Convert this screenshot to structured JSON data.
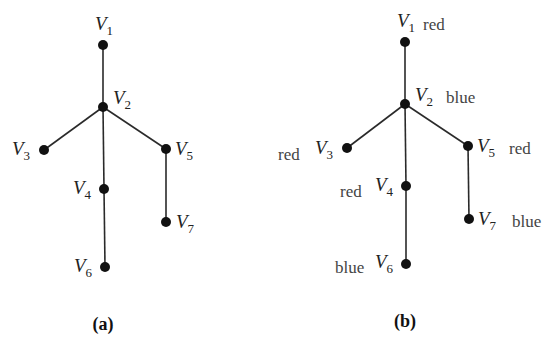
{
  "figures": [
    {
      "id": "a",
      "caption": "(a)",
      "vertices": [
        {
          "name": "V",
          "sub": "1",
          "color": ""
        },
        {
          "name": "V",
          "sub": "2",
          "color": ""
        },
        {
          "name": "V",
          "sub": "3",
          "color": ""
        },
        {
          "name": "V",
          "sub": "4",
          "color": ""
        },
        {
          "name": "V",
          "sub": "5",
          "color": ""
        },
        {
          "name": "V",
          "sub": "6",
          "color": ""
        },
        {
          "name": "V",
          "sub": "7",
          "color": ""
        }
      ]
    },
    {
      "id": "b",
      "caption": "(b)",
      "vertices": [
        {
          "name": "V",
          "sub": "1",
          "color": "red"
        },
        {
          "name": "V",
          "sub": "2",
          "color": "blue"
        },
        {
          "name": "V",
          "sub": "3",
          "color": "red"
        },
        {
          "name": "V",
          "sub": "4",
          "color": "red"
        },
        {
          "name": "V",
          "sub": "5",
          "color": "red"
        },
        {
          "name": "V",
          "sub": "6",
          "color": "blue"
        },
        {
          "name": "V",
          "sub": "7",
          "color": "blue"
        }
      ]
    }
  ],
  "edges": [
    [
      "V1",
      "V2"
    ],
    [
      "V2",
      "V3"
    ],
    [
      "V2",
      "V4"
    ],
    [
      "V2",
      "V5"
    ],
    [
      "V4",
      "V6"
    ],
    [
      "V5",
      "V7"
    ]
  ]
}
